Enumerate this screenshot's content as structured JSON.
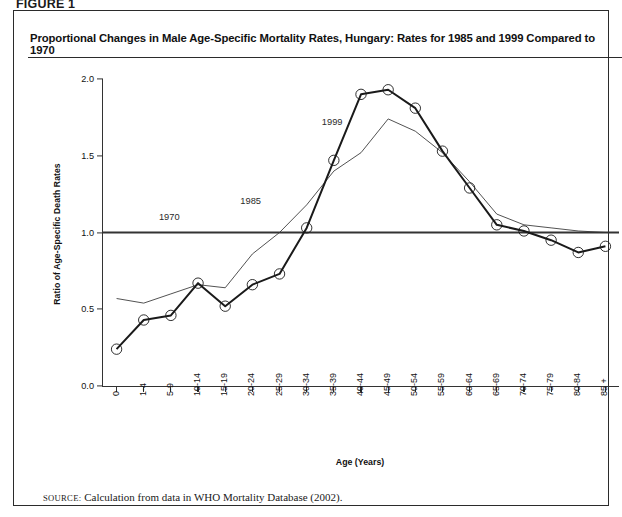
{
  "figure": {
    "tag": "FIGURE 1",
    "title": "Proportional Changes in Male Age-Specific Mortality Rates, Hungary: Rates for 1985 and 1999 Compared to 1970",
    "source_prefix": "Source:",
    "source_text": "Calculation from data in WHO Mortality Database (2002)."
  },
  "chart_data": {
    "type": "line",
    "title": "Proportional Changes in Male Age-Specific Mortality Rates, Hungary: Rates for 1985 and 1999 Compared to 1970",
    "xlabel": "Age (Years)",
    "ylabel": "Ratio of Age-Specific Death Rates",
    "ylim": [
      0.0,
      2.0
    ],
    "yticks": [
      0.0,
      0.5,
      1.0,
      1.5,
      2.0
    ],
    "ytick_labels": [
      "0.0",
      "0.5",
      "1.0",
      "1.5",
      "2.0"
    ],
    "grid": false,
    "legend": "inline-labels",
    "categories": [
      "0",
      "1-4",
      "5-9",
      "10-14",
      "15-19",
      "20-24",
      "25-29",
      "30-34",
      "35-39",
      "40-44",
      "45-49",
      "50-54",
      "55-59",
      "60-64",
      "65-69",
      "70-74",
      "75-79",
      "80-84",
      "85 +"
    ],
    "series": [
      {
        "name": "1970",
        "style": "thick-flat-reference",
        "color": "#333333",
        "values": [
          1.0,
          1.0,
          1.0,
          1.0,
          1.0,
          1.0,
          1.0,
          1.0,
          1.0,
          1.0,
          1.0,
          1.0,
          1.0,
          1.0,
          1.0,
          1.0,
          1.0,
          1.0,
          1.0
        ],
        "label_text": "1970",
        "label_x_category": "5-9",
        "label_y": 1.09
      },
      {
        "name": "1985",
        "style": "thin",
        "color": "#333333",
        "markers": false,
        "values": [
          0.57,
          0.54,
          0.6,
          0.66,
          0.64,
          0.86,
          1.0,
          1.18,
          1.4,
          1.52,
          1.74,
          1.66,
          1.52,
          1.33,
          1.12,
          1.05,
          1.03,
          1.01,
          1.0
        ],
        "label_text": "1985",
        "label_x_category": "20-24",
        "label_y": 1.19
      },
      {
        "name": "1999",
        "style": "thick-with-circle-markers",
        "color": "#1a1a1a",
        "markers": true,
        "values": [
          0.24,
          0.43,
          0.46,
          0.67,
          0.52,
          0.66,
          0.73,
          1.03,
          1.47,
          1.9,
          1.93,
          1.81,
          1.53,
          1.29,
          1.05,
          1.01,
          0.95,
          0.87,
          0.91
        ],
        "label_text": "1999",
        "label_x_category": "35-39",
        "label_y": 1.71
      }
    ]
  }
}
